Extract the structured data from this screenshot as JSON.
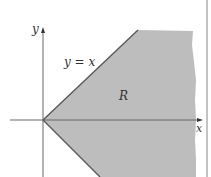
{
  "figure": {
    "labels": {
      "y_axis": "y",
      "x_axis": "x",
      "line": "y = x",
      "region": "R"
    },
    "colors": {
      "region_fill": "#bdbdbd",
      "boundary": "#555555",
      "axis": "#666666",
      "frame": "#888888",
      "background": "#ffffff"
    }
  }
}
